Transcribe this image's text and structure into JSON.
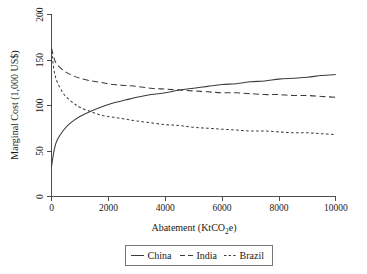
{
  "chart_data": {
    "type": "line",
    "title": "",
    "xlabel": "Abatement (KtCO2e)",
    "xlabel_parts": {
      "pre": "Abatement (KtCO",
      "sub": "2",
      "post": "e)"
    },
    "ylabel": "Marginal Cost (1,000 US$)",
    "xlim": [
      0,
      10000
    ],
    "ylim": [
      0,
      200
    ],
    "xticks": [
      0,
      2000,
      4000,
      6000,
      8000,
      10000
    ],
    "xtick_labels": [
      "0",
      "2000",
      "4000",
      "6000",
      "8000",
      "10000"
    ],
    "yticks": [
      0,
      50,
      100,
      150,
      200
    ],
    "ytick_labels": [
      "0",
      "50",
      "100",
      "150",
      "200"
    ],
    "grid": false,
    "legend_position": "below-center",
    "x": [
      0,
      100,
      200,
      400,
      600,
      800,
      1000,
      1400,
      1800,
      2200,
      2600,
      3000,
      3500,
      4000,
      4500,
      5000,
      5500,
      6000,
      6500,
      7000,
      7500,
      8000,
      8500,
      9000,
      9500,
      10000
    ],
    "series": [
      {
        "name": "China",
        "linestyle": "solid",
        "color": "#3c3c3c",
        "values": [
          33,
          52,
          62,
          72,
          79,
          84,
          88,
          94,
          99,
          103,
          106,
          109,
          112,
          114,
          117,
          119,
          121,
          123,
          124,
          126,
          127,
          129,
          130,
          131,
          133,
          134
        ]
      },
      {
        "name": "India",
        "linestyle": "dashed",
        "color": "#3c3c3c",
        "values": [
          163,
          151,
          145,
          139,
          135,
          132,
          130,
          127,
          125,
          123,
          122,
          121,
          119,
          118,
          117,
          116,
          115,
          114,
          114,
          113,
          112,
          112,
          111,
          111,
          110,
          109
        ]
      },
      {
        "name": "Brazil",
        "linestyle": "dotted",
        "color": "#3c3c3c",
        "values": [
          160,
          137,
          126,
          114,
          107,
          102,
          98,
          93,
          89,
          87,
          85,
          83,
          81,
          79,
          78,
          76,
          75,
          74,
          73,
          72,
          72,
          71,
          70,
          70,
          69,
          68
        ]
      }
    ],
    "legend_entries": [
      {
        "label": "China",
        "linestyle": "solid"
      },
      {
        "label": "India",
        "linestyle": "dashed"
      },
      {
        "label": "Brazil",
        "linestyle": "dotted"
      }
    ]
  }
}
